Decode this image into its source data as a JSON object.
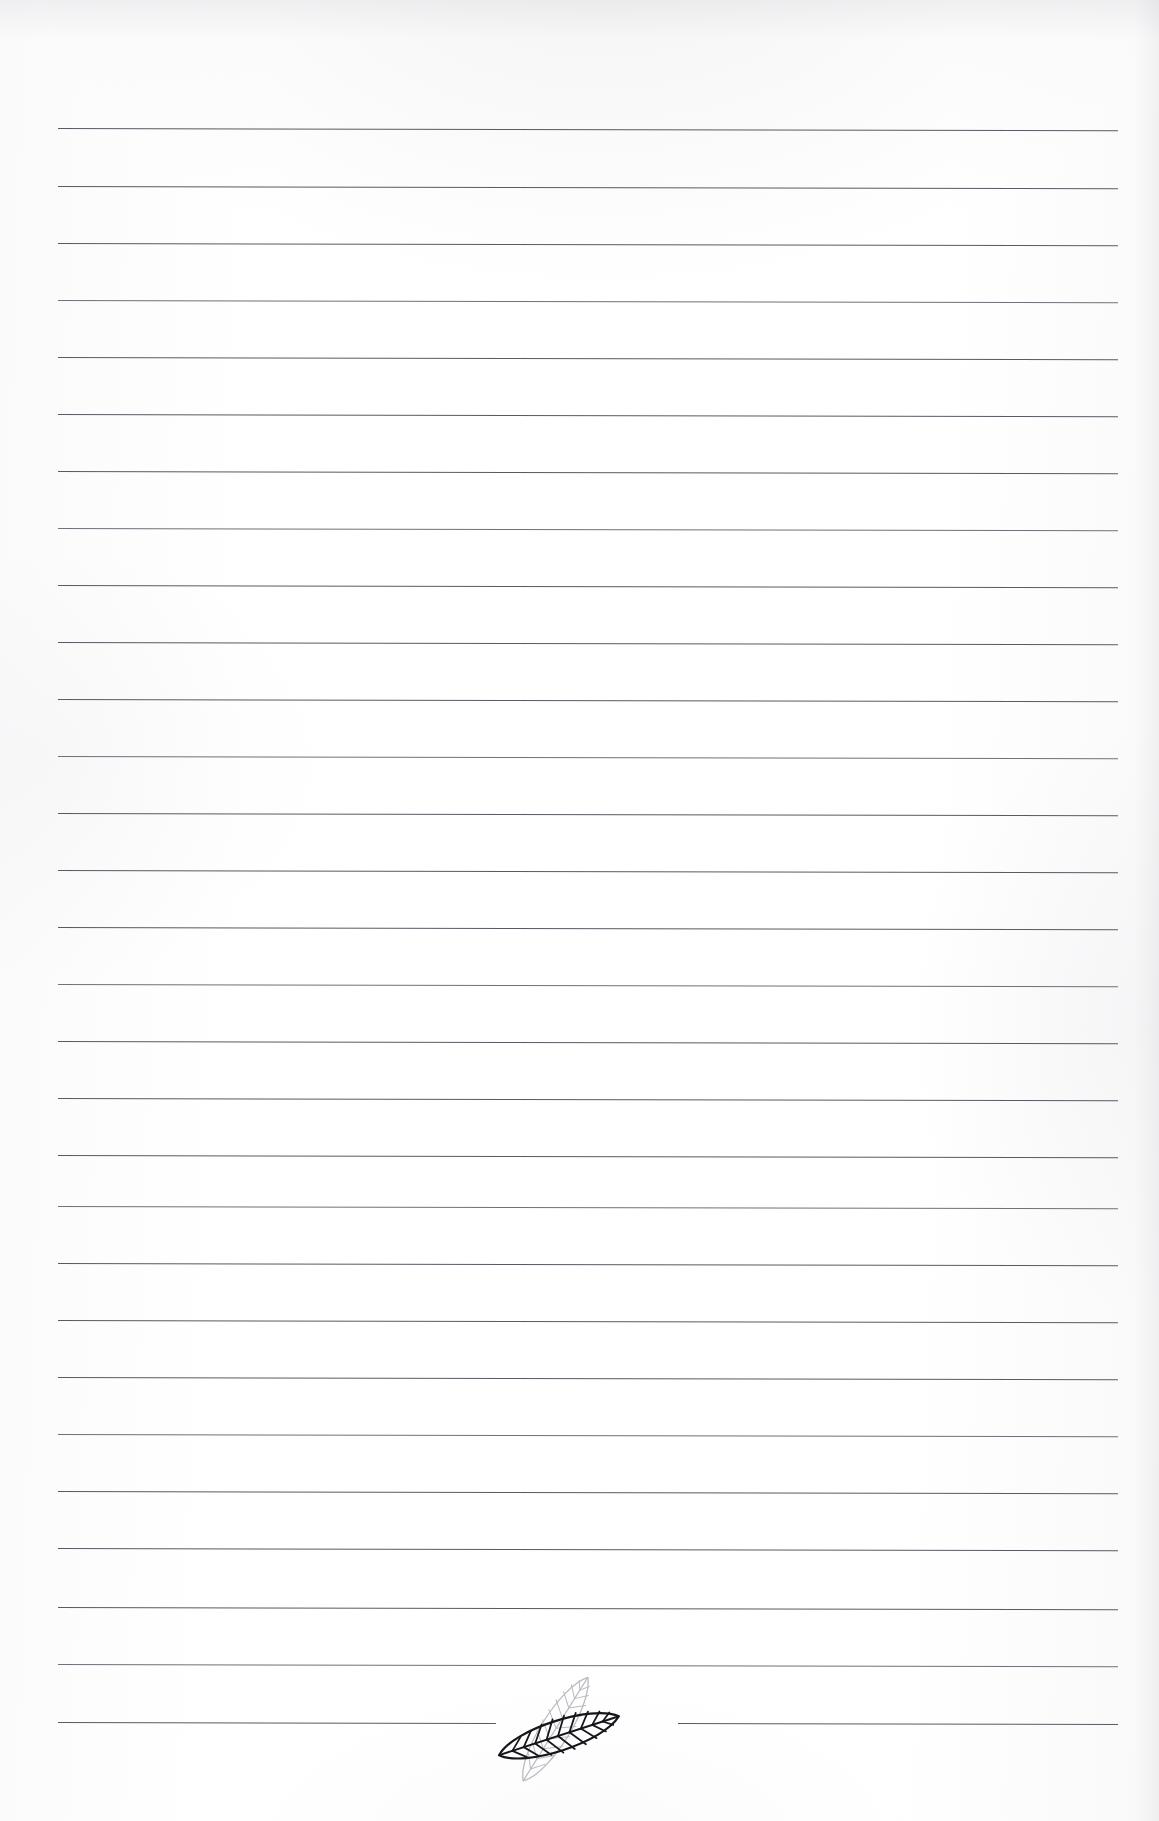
{
  "page": {
    "kind": "ruled-stationery-sheet",
    "width_px": 1159,
    "height_px": 1821,
    "background_color": "#fefefe",
    "paper_edge_shadow_color": "#969aa0"
  },
  "ruling": {
    "line_color": "#4e4e57",
    "line_thickness_px": 1.35,
    "line_count": 29,
    "left_margin_px": 58,
    "right_margin_px": 1118,
    "first_line_y_px": 128,
    "line_spacing_px": 57.1,
    "slope_deg": 0.12,
    "note": "Feint horizontal rules, no vertical margin rule, no text written on the sheet"
  },
  "ornament": {
    "name": "twin-leaf-ornament",
    "description": "Two overlapping line-art leaves splitting the final ruled line",
    "front_leaf": {
      "label": "dark-leaf",
      "stroke_color": "#15151a",
      "stroke_width_px": 2.1,
      "tilt_deg": -18,
      "vein_count": 11
    },
    "back_leaf": {
      "label": "light-leaf",
      "stroke_color": "#b9b9c0",
      "stroke_width_px": 1.2,
      "tilt_deg": -58,
      "vein_count": 11
    },
    "center_x_px": 578,
    "center_y_px": 1734,
    "split_line_index": 29,
    "split_gap_left_end_px": 496,
    "split_gap_right_start_px": 678
  },
  "lines": [
    {
      "i": 1,
      "y": 128.0,
      "x1": 58,
      "x2": 1118,
      "split": false
    },
    {
      "i": 2,
      "y": 185.5,
      "x1": 58,
      "x2": 1118,
      "split": false
    },
    {
      "i": 3,
      "y": 243.0,
      "x1": 58,
      "x2": 1118,
      "split": false
    },
    {
      "i": 4,
      "y": 300.0,
      "x1": 58,
      "x2": 1118,
      "split": false
    },
    {
      "i": 5,
      "y": 357.0,
      "x1": 58,
      "x2": 1118,
      "split": false
    },
    {
      "i": 6,
      "y": 414.0,
      "x1": 58,
      "x2": 1118,
      "split": false
    },
    {
      "i": 7,
      "y": 470.5,
      "x1": 58,
      "x2": 1118,
      "split": false
    },
    {
      "i": 8,
      "y": 527.5,
      "x1": 58,
      "x2": 1118,
      "split": false
    },
    {
      "i": 9,
      "y": 584.5,
      "x1": 58,
      "x2": 1118,
      "split": false
    },
    {
      "i": 10,
      "y": 641.5,
      "x1": 58,
      "x2": 1118,
      "split": false
    },
    {
      "i": 11,
      "y": 699.0,
      "x1": 58,
      "x2": 1118,
      "split": false
    },
    {
      "i": 12,
      "y": 756.0,
      "x1": 58,
      "x2": 1118,
      "split": false
    },
    {
      "i": 13,
      "y": 813.0,
      "x1": 58,
      "x2": 1118,
      "split": false
    },
    {
      "i": 14,
      "y": 870.0,
      "x1": 58,
      "x2": 1118,
      "split": false
    },
    {
      "i": 15,
      "y": 927.0,
      "x1": 58,
      "x2": 1118,
      "split": false
    },
    {
      "i": 16,
      "y": 984.0,
      "x1": 58,
      "x2": 1118,
      "split": false
    },
    {
      "i": 17,
      "y": 1041.0,
      "x1": 58,
      "x2": 1118,
      "split": false
    },
    {
      "i": 18,
      "y": 1098.0,
      "x1": 58,
      "x2": 1118,
      "split": false
    },
    {
      "i": 19,
      "y": 1155.0,
      "x1": 58,
      "x2": 1118,
      "split": false
    },
    {
      "i": 20,
      "y": 1206.0,
      "x1": 58,
      "x2": 1118,
      "split": false
    },
    {
      "i": 21,
      "y": 1263.0,
      "x1": 58,
      "x2": 1118,
      "split": false
    },
    {
      "i": 22,
      "y": 1320.0,
      "x1": 58,
      "x2": 1118,
      "split": false
    },
    {
      "i": 23,
      "y": 1377.0,
      "x1": 58,
      "x2": 1118,
      "split": false
    },
    {
      "i": 24,
      "y": 1434.0,
      "x1": 58,
      "x2": 1118,
      "split": false
    },
    {
      "i": 25,
      "y": 1491.0,
      "x1": 58,
      "x2": 1118,
      "split": false
    },
    {
      "i": 26,
      "y": 1548.0,
      "x1": 58,
      "x2": 1118,
      "split": false
    },
    {
      "i": 27,
      "y": 1607.0,
      "x1": 58,
      "x2": 1118,
      "split": false
    },
    {
      "i": 28,
      "y": 1664.0,
      "x1": 58,
      "x2": 1118,
      "split": false
    },
    {
      "i": 29,
      "y": 1722.0,
      "x1": 58,
      "x2": 1118,
      "split": true
    }
  ]
}
